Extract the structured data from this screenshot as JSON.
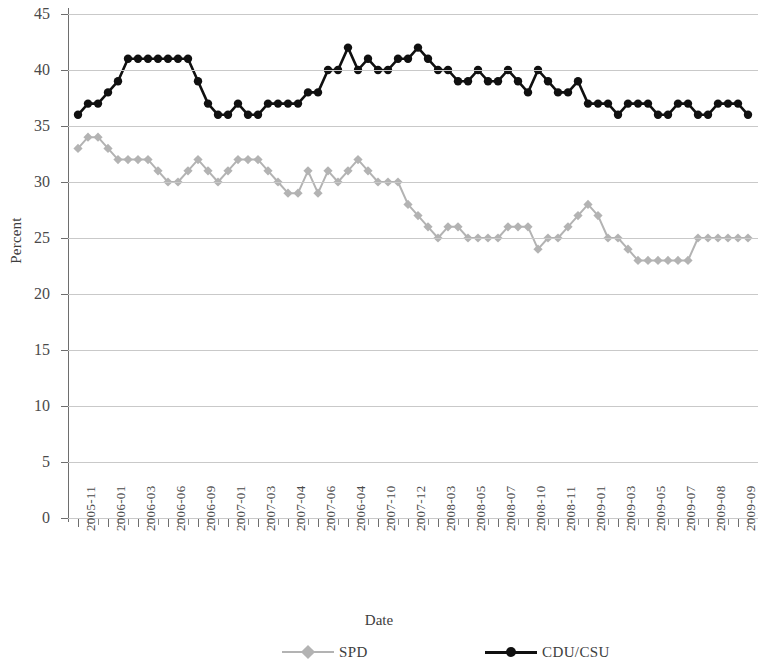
{
  "chart_data": {
    "type": "line",
    "title": "",
    "xlabel": "Date",
    "ylabel": "Percent",
    "ylim": [
      0,
      45
    ],
    "ytick_step": 5,
    "yticks": [
      45,
      40,
      35,
      30,
      25,
      20,
      15,
      10,
      5,
      0
    ],
    "grid": true,
    "legend_position": "bottom",
    "x_tick_labels": [
      "2005-11",
      "2006-01",
      "2006-03",
      "2006-06",
      "2006-09",
      "2007-01",
      "2007-03",
      "2007-04",
      "2007-06",
      "2006-04",
      "2007-10",
      "2007-12",
      "2008-03",
      "2008-05",
      "2008-07",
      "2008-10",
      "2008-11",
      "2009-01",
      "2009-03",
      "2009-05",
      "2009-07",
      "2009-08",
      "2009-09"
    ],
    "x_tick_index": [
      0,
      3,
      6,
      9,
      12,
      15,
      18,
      21,
      24,
      27,
      30,
      33,
      36,
      39,
      42,
      45,
      48,
      51,
      54,
      57,
      60,
      63,
      66
    ],
    "n_points": 68,
    "series": [
      {
        "name": "SPD",
        "color": "#b3b3b3",
        "marker": "diamond",
        "values": [
          33,
          34,
          34,
          33,
          32,
          32,
          32,
          32,
          31,
          30,
          30,
          31,
          32,
          31,
          30,
          31,
          32,
          32,
          32,
          31,
          30,
          29,
          29,
          31,
          29,
          31,
          30,
          31,
          32,
          31,
          30,
          30,
          30,
          28,
          27,
          26,
          25,
          26,
          26,
          25,
          25,
          25,
          25,
          26,
          26,
          26,
          24,
          25,
          25,
          26,
          27,
          28,
          27,
          25,
          25,
          24,
          23,
          23,
          23,
          23,
          23,
          23,
          25,
          25,
          25,
          25,
          25,
          25
        ]
      },
      {
        "name": "CDU/CSU",
        "color": "#101010",
        "marker": "circle",
        "values": [
          36,
          37,
          37,
          38,
          39,
          41,
          41,
          41,
          41,
          41,
          41,
          41,
          39,
          37,
          36,
          36,
          37,
          36,
          36,
          37,
          37,
          37,
          37,
          38,
          38,
          40,
          40,
          42,
          40,
          41,
          40,
          40,
          41,
          41,
          42,
          41,
          40,
          40,
          39,
          39,
          40,
          39,
          39,
          40,
          39,
          38,
          40,
          39,
          38,
          38,
          39,
          37,
          37,
          37,
          36,
          37,
          37,
          37,
          36,
          36,
          37,
          37,
          36,
          36,
          37,
          37,
          37,
          36
        ]
      }
    ]
  },
  "legend": {
    "entries": [
      {
        "label": "SPD"
      },
      {
        "label": "CDU/CSU"
      }
    ]
  },
  "axes": {
    "y_title": "Percent",
    "x_title": "Date"
  }
}
